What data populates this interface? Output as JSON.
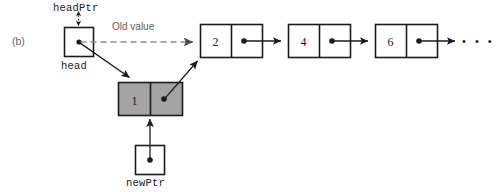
{
  "figure": {
    "label": "(b)",
    "caption_old_value": "Old value"
  },
  "pointers": {
    "headPtr": {
      "name": "headPtr",
      "box_label": "head"
    },
    "newPtr": {
      "name": "newPtr"
    }
  },
  "new_node": {
    "value": "1",
    "fill_color": "#a3a3a3",
    "border_color": "#1b1b1b"
  },
  "list_nodes": [
    {
      "value": "2"
    },
    {
      "value": "4"
    },
    {
      "value": "6"
    }
  ],
  "tail": {
    "ellipsis": "• • •"
  },
  "colors": {
    "stroke": "#1b1b1b",
    "dashed_stroke": "#8c8c8c",
    "text": "#1b1b1b",
    "muted_text": "#5d5d5d",
    "background": "#ffffff"
  }
}
